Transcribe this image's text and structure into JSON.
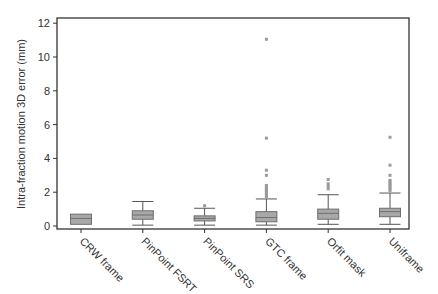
{
  "chart_data": {
    "type": "box",
    "title": "",
    "xlabel": "",
    "ylabel": "Intra-fraction motion 3D error (mm)",
    "ylim": [
      0,
      12
    ],
    "yticks": [
      0,
      2,
      4,
      6,
      8,
      10,
      12
    ],
    "grid": false,
    "legend": null,
    "categories": [
      "CRW frame",
      "PinPoint FSRT",
      "PinPoint SRS",
      "GTC frame",
      "Orfit mask",
      "Uniframe"
    ],
    "series": [
      {
        "name": "CRW frame",
        "whisker_low": 0.1,
        "q1": 0.1,
        "median": 0.45,
        "q3": 0.7,
        "whisker_high": 0.7,
        "outliers": []
      },
      {
        "name": "PinPoint FSRT",
        "whisker_low": 0.05,
        "q1": 0.4,
        "median": 0.65,
        "q3": 0.9,
        "whisker_high": 1.45,
        "outliers": []
      },
      {
        "name": "PinPoint SRS",
        "whisker_low": 0.05,
        "q1": 0.3,
        "median": 0.45,
        "q3": 0.6,
        "whisker_high": 1.05,
        "outliers": [
          1.2
        ]
      },
      {
        "name": "GTC frame",
        "whisker_low": 0.05,
        "q1": 0.25,
        "median": 0.5,
        "q3": 0.85,
        "whisker_high": 1.6,
        "outliers": [
          1.7,
          1.8,
          1.9,
          2.0,
          2.1,
          2.2,
          2.3,
          2.4,
          3.0,
          3.3,
          5.2,
          11.05
        ]
      },
      {
        "name": "Orfit mask",
        "whisker_low": 0.1,
        "q1": 0.4,
        "median": 0.75,
        "q3": 1.0,
        "whisker_high": 1.85,
        "outliers": [
          2.2,
          2.35,
          2.5,
          2.75
        ]
      },
      {
        "name": "Uniframe",
        "whisker_low": 0.1,
        "q1": 0.55,
        "median": 0.85,
        "q3": 1.05,
        "whisker_high": 1.95,
        "outliers": [
          2.1,
          2.2,
          2.3,
          2.4,
          2.5,
          2.6,
          2.7,
          3.0,
          3.6,
          5.25
        ]
      }
    ]
  },
  "colors": {
    "box_fill": "#a8a8a8",
    "box_stroke": "#6e6e6e",
    "median": "#6e6e6e",
    "whisker": "#555555",
    "outlier": "#9a9a9a",
    "axis": "#333333"
  }
}
